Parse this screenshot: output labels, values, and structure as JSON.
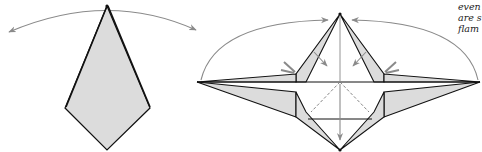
{
  "caption": {
    "lines": [
      "even",
      "are s",
      "flam"
    ]
  },
  "colors": {
    "paper_fill": "#dcdcdc",
    "outline": "#111111",
    "arrow": "#8a8a8a",
    "crease": "#777777",
    "background": "#ffffff"
  },
  "figures": [
    {
      "name": "kite-base",
      "description": "Folded kite shape with swing arrows indicating both sides opening"
    },
    {
      "name": "opened-star-base",
      "description": "Opened model with flaps spread left and right, petal folds and arrows"
    }
  ]
}
